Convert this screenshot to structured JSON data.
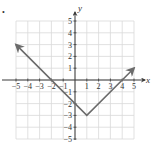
{
  "figure": {
    "marker": "•"
  },
  "chart_data": {
    "type": "line",
    "title": "",
    "xlabel": "x",
    "ylabel": "y",
    "xlim": [
      -5,
      5
    ],
    "ylim": [
      -5,
      5
    ],
    "grid": true,
    "x_ticks": [
      "-5",
      "-4",
      "-3",
      "-2",
      "-1",
      "1",
      "2",
      "3",
      "4",
      "5"
    ],
    "y_ticks": [
      "5",
      "4",
      "3",
      "2",
      "1",
      "-1",
      "-2",
      "-3",
      "-4",
      "-5"
    ],
    "series": [
      {
        "name": "y = |x - 1| - 3",
        "points": [
          [
            -5,
            3
          ],
          [
            1,
            -3
          ],
          [
            5,
            1
          ]
        ],
        "arrows": [
          "start",
          "end"
        ],
        "color": "#6b6b6b"
      }
    ],
    "vertex": [
      1,
      -3
    ],
    "x_intercepts": [
      -2,
      4
    ],
    "y_intercept": -2
  },
  "colors": {
    "grid": "#d9d9d9",
    "axis": "#3a3a3a",
    "curve": "#6b6b6b",
    "text": "#333333"
  }
}
